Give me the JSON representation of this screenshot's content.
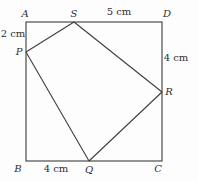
{
  "figure": {
    "background_color": "#fdfdfd",
    "stroke_color": "#3d3d3d",
    "label_color": "#2f2f2f",
    "square": {
      "x": 26,
      "y": 22,
      "width": 136,
      "height": 139
    },
    "vertices": {
      "A": {
        "x": 26,
        "y": 22
      },
      "D": {
        "x": 162,
        "y": 22
      },
      "B": {
        "x": 26,
        "y": 161
      },
      "C": {
        "x": 162,
        "y": 161
      },
      "S": {
        "x": 74,
        "y": 22
      },
      "P": {
        "x": 26,
        "y": 52
      },
      "R": {
        "x": 162,
        "y": 92
      },
      "Q": {
        "x": 89,
        "y": 161
      }
    },
    "segments": [
      {
        "name": "segment-PS",
        "from": "P",
        "to": "S"
      },
      {
        "name": "segment-SR",
        "from": "S",
        "to": "R"
      },
      {
        "name": "segment-RQ",
        "from": "R",
        "to": "Q"
      },
      {
        "name": "segment-QP",
        "from": "Q",
        "to": "P"
      }
    ],
    "labels": [
      {
        "name": "vertex-label-A",
        "text": "A",
        "x": 25,
        "y": 17,
        "style": "italic"
      },
      {
        "name": "vertex-label-S",
        "text": "S",
        "x": 74,
        "y": 17,
        "style": "italic"
      },
      {
        "name": "measurement-label-SD-5cm",
        "text": "5 cm",
        "x": 119,
        "y": 15,
        "style": "normal"
      },
      {
        "name": "vertex-label-D",
        "text": "D",
        "x": 167,
        "y": 17,
        "style": "italic"
      },
      {
        "name": "measurement-label-AP-2cm",
        "text": "2 cm",
        "x": 13,
        "y": 37,
        "style": "normal"
      },
      {
        "name": "vertex-label-P",
        "text": "P",
        "x": 19,
        "y": 55,
        "style": "italic"
      },
      {
        "name": "measurement-label-DR-4cm",
        "text": "4 cm",
        "x": 176,
        "y": 61,
        "style": "normal"
      },
      {
        "name": "vertex-label-R",
        "text": "R",
        "x": 169,
        "y": 95,
        "style": "italic"
      },
      {
        "name": "vertex-label-B",
        "text": "B",
        "x": 18,
        "y": 172,
        "style": "italic"
      },
      {
        "name": "measurement-label-BQ-4cm",
        "text": "4 cm",
        "x": 56,
        "y": 172,
        "style": "normal"
      },
      {
        "name": "vertex-label-Q",
        "text": "Q",
        "x": 89,
        "y": 173,
        "style": "italic"
      },
      {
        "name": "vertex-label-C",
        "text": "C",
        "x": 158,
        "y": 172,
        "style": "italic"
      }
    ]
  }
}
